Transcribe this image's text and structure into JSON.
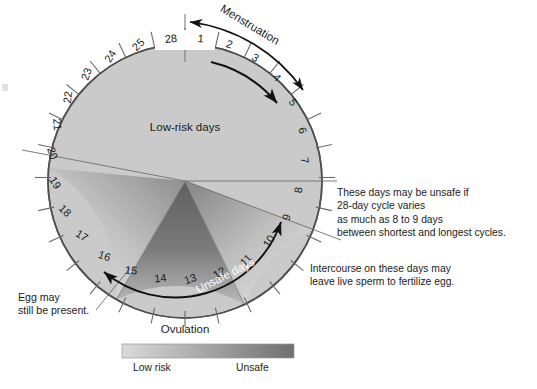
{
  "diagram": {
    "center_label": "Low-risk days",
    "unsafe_label": "Unsafe days",
    "menstruation_label": "Menstruation",
    "ovulation_label": "Ovulation",
    "egg_note": "Egg may\nstill be present.",
    "days": [
      1,
      2,
      3,
      4,
      5,
      6,
      7,
      8,
      9,
      10,
      11,
      12,
      13,
      14,
      15,
      16,
      17,
      18,
      19,
      20,
      21,
      22,
      23,
      24,
      25,
      26,
      27,
      28
    ],
    "total_days": 28,
    "menstruation_days": [
      1,
      2,
      3,
      4,
      5
    ],
    "unsafe_days_range": [
      9,
      17
    ],
    "ovulation_days": [
      14,
      15
    ],
    "colors": {
      "low_risk_fill": "#c9c9c9",
      "unsafe_dark": "#6e6e6e",
      "unsafe_mid": "#9a9a9a",
      "unsafe_light": "#d2d2d2",
      "outline": "#4a4a4a",
      "tick": "#6a6a6a",
      "text": "#1b1b1b",
      "unsafe_text": "#ffffff"
    }
  },
  "notes": {
    "unsafe_cycle_variation": "These days may be unsafe if\n28-day cycle varies\nas much as 8 to 9 days\nbetween shortest and longest cycles.",
    "intercourse": "Intercourse on these days may\nleave live sperm to fertilize egg."
  },
  "legend": {
    "low_label": "Low risk",
    "high_label": "Unsafe",
    "gradient_from": "#d9d9d9",
    "gradient_to": "#6f6f6f"
  }
}
